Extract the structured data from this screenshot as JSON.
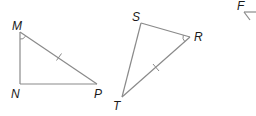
{
  "diagram": {
    "type": "geometry-triangles",
    "stroke_color": "#8a8a8a",
    "label_color": "#1a1a1a",
    "triangles": [
      {
        "name": "MNP",
        "vertices": {
          "M": {
            "label": "M",
            "x": 20,
            "y": 32,
            "label_x": 12,
            "label_y": 30
          },
          "N": {
            "label": "N",
            "x": 20,
            "y": 84,
            "label_x": 11,
            "label_y": 98
          },
          "P": {
            "label": "P",
            "x": 97,
            "y": 84,
            "label_x": 94,
            "label_y": 98
          }
        },
        "congruence_tick_side": "MP",
        "angle_mark_vertex": "M"
      },
      {
        "name": "SRT",
        "vertices": {
          "S": {
            "label": "S",
            "x": 141,
            "y": 23,
            "label_x": 132,
            "label_y": 21
          },
          "R": {
            "label": "R",
            "x": 190,
            "y": 37,
            "label_x": 194,
            "label_y": 41
          },
          "T": {
            "label": "T",
            "x": 122,
            "y": 97,
            "label_x": 113,
            "label_y": 110
          }
        },
        "congruence_tick_side": "RT",
        "angle_mark_vertex": "R"
      },
      {
        "name": "F-partial",
        "vertices": {
          "F": {
            "label": "F",
            "x": 244,
            "y": 12,
            "label_x": 237,
            "label_y": 10
          }
        },
        "partial": true
      }
    ]
  }
}
